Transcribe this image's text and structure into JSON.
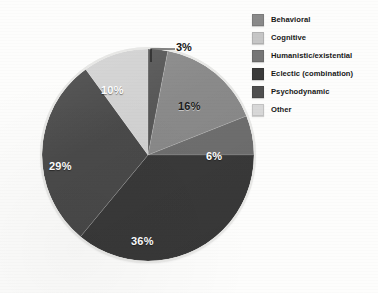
{
  "chart_data": {
    "type": "pie",
    "title": "",
    "subtitle": "",
    "xlabel": "",
    "ylabel": "",
    "legend_position": "right",
    "grid": false,
    "value_suffix": "%",
    "categories": [
      "Behavioral",
      "Cognitive",
      "Humanistic/existential",
      "Eclectic (combination)",
      "Psychodynamic",
      "Other"
    ],
    "values": [
      16,
      6,
      3,
      36,
      29,
      10
    ],
    "colors": [
      "#8a8a8a",
      "#6f6f6f",
      "#575757",
      "#3a3a3a",
      "#4a4a4a",
      "#d2d2d2"
    ],
    "slices": [
      {
        "label": "Humanistic/existential",
        "value": 3,
        "display": "3%",
        "color": "#575757",
        "label_style": "callout",
        "label_color": "dark",
        "start_pct": 0,
        "end_pct": 3
      },
      {
        "label": "Behavioral",
        "value": 16,
        "display": "16%",
        "color": "#8a8a8a",
        "label_style": "inside",
        "label_color": "dark",
        "start_pct": 3,
        "end_pct": 19
      },
      {
        "label": "Cognitive",
        "value": 6,
        "display": "6%",
        "color": "#6f6f6f",
        "label_style": "inside",
        "label_color": "light",
        "start_pct": 19,
        "end_pct": 25
      },
      {
        "label": "Eclectic (combination)",
        "value": 36,
        "display": "36%",
        "color": "#3a3a3a",
        "label_style": "inside",
        "label_color": "light",
        "start_pct": 25,
        "end_pct": 61
      },
      {
        "label": "Psychodynamic",
        "value": 29,
        "display": "29%",
        "color": "#4a4a4a",
        "label_style": "inside",
        "label_color": "light",
        "start_pct": 61,
        "end_pct": 90
      },
      {
        "label": "Other",
        "value": 10,
        "display": "10%",
        "color": "#d2d2d2",
        "label_style": "inside",
        "label_color": "light",
        "start_pct": 90,
        "end_pct": 100
      }
    ]
  },
  "labels": {
    "slice_3": "3%",
    "slice_16": "16%",
    "slice_6": "6%",
    "slice_36": "36%",
    "slice_29": "29%",
    "slice_10": "10%"
  },
  "legend": {
    "items": [
      {
        "label": "Behavioral",
        "color": "#8a8a8a"
      },
      {
        "label": "Cognitive",
        "color": "#c6c6c6"
      },
      {
        "label": "Humanistic/existential",
        "color": "#767676"
      },
      {
        "label": "Eclectic (combination)",
        "color": "#3a3a3a"
      },
      {
        "label": "Psychodynamic",
        "color": "#4f4f4f"
      },
      {
        "label": "Other",
        "color": "#d8d8d8"
      }
    ]
  }
}
